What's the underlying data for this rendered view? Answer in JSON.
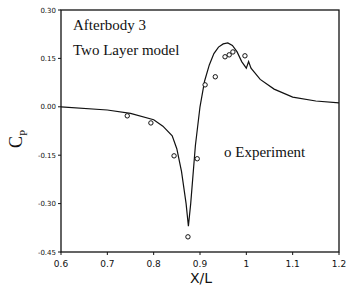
{
  "chart_data": {
    "type": "line",
    "title": "",
    "annotations": [
      "Afterbody 3",
      "Two Layer model"
    ],
    "xlabel": "X/L",
    "ylabel": "CP",
    "xlim": [
      0.6,
      1.2
    ],
    "ylim": [
      -0.45,
      0.3
    ],
    "xticks": [
      "0.6",
      "0.7",
      "0.8",
      "0.9",
      "1",
      "1.1",
      "1.2"
    ],
    "yticks": [
      "0.30",
      "0.15",
      "0.00",
      "-0.15",
      "-0.30",
      "-0.45"
    ],
    "grid": false,
    "legend": {
      "position": "inside-right",
      "entries": [
        "o  Experiment"
      ]
    },
    "series": [
      {
        "name": "Two Layer model",
        "style": "line",
        "x": [
          0.6,
          0.7,
          0.75,
          0.8,
          0.82,
          0.84,
          0.85,
          0.86,
          0.87,
          0.875,
          0.88,
          0.89,
          0.9,
          0.91,
          0.92,
          0.93,
          0.94,
          0.95,
          0.96,
          0.97,
          0.98,
          0.99,
          1.0,
          1.005,
          1.01,
          1.03,
          1.06,
          1.1,
          1.15,
          1.2
        ],
        "y": [
          0.0,
          -0.01,
          -0.02,
          -0.04,
          -0.06,
          -0.09,
          -0.13,
          -0.2,
          -0.3,
          -0.37,
          -0.3,
          -0.12,
          0.0,
          0.08,
          0.13,
          0.165,
          0.185,
          0.195,
          0.198,
          0.19,
          0.17,
          0.14,
          0.12,
          0.14,
          0.12,
          0.085,
          0.055,
          0.03,
          0.018,
          0.012
        ]
      },
      {
        "name": "Experiment",
        "style": "marker-open-circle",
        "x": [
          0.743,
          0.794,
          0.844,
          0.874,
          0.894,
          0.911,
          0.933,
          0.954,
          0.963,
          0.971,
          0.997
        ],
        "y": [
          -0.028,
          -0.05,
          -0.152,
          -0.403,
          -0.161,
          0.068,
          0.093,
          0.155,
          0.161,
          0.17,
          0.158
        ]
      }
    ]
  }
}
